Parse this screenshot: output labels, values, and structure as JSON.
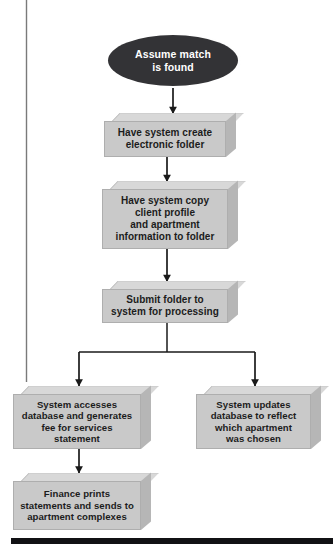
{
  "diagram": {
    "colors": {
      "terminator_fill": "#333336",
      "terminator_text": "#ffffff",
      "box_front": "#c9c9c9",
      "box_top": "#d8d8d8",
      "box_side": "#b6b6b6",
      "box_text": "#1c1c1c",
      "connector": "#1a1a1a",
      "margin_rule": "#6f6f6f",
      "bottom_rule": "#111114"
    },
    "nodes": [
      {
        "id": "start",
        "type": "terminator",
        "label": "Assume match\nis found",
        "line1": "Assume match",
        "line2": "is found"
      },
      {
        "id": "create-folder",
        "type": "process",
        "label": "Have system create\nelectronic folder"
      },
      {
        "id": "copy-profile",
        "type": "process",
        "label": "Have system copy\nclient profile\nand apartment\ninformation to folder"
      },
      {
        "id": "submit-folder",
        "type": "process",
        "label": "Submit folder to\nsystem for processing"
      },
      {
        "id": "access-database",
        "type": "process",
        "label": "System accesses\ndatabase and generates\nfee for services\nstatement"
      },
      {
        "id": "update-database",
        "type": "process",
        "label": "System updates\ndatabase to reflect\nwhich apartment\nwas chosen"
      },
      {
        "id": "finance-prints",
        "type": "process",
        "label": "Finance prints\nstatements and sends to\napartment complexes"
      }
    ],
    "edges": [
      {
        "from": "start",
        "to": "create-folder"
      },
      {
        "from": "create-folder",
        "to": "copy-profile"
      },
      {
        "from": "copy-profile",
        "to": "submit-folder"
      },
      {
        "from": "submit-folder",
        "to": "access-database"
      },
      {
        "from": "submit-folder",
        "to": "update-database"
      },
      {
        "from": "access-database",
        "to": "finance-prints"
      }
    ]
  }
}
